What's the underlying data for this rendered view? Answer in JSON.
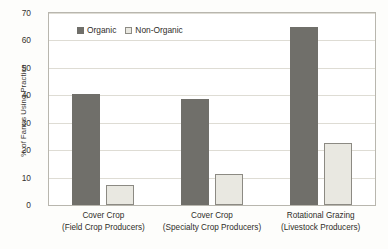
{
  "chart_data": {
    "type": "bar",
    "title": "",
    "xlabel": "",
    "ylabel": "% of Farms Using Practice",
    "ylim": [
      0,
      70
    ],
    "yticks": [
      0,
      10,
      20,
      30,
      40,
      50,
      60,
      70
    ],
    "ytick_labels": [
      "0",
      "10",
      "20",
      "30",
      "40",
      "50",
      "60",
      "70"
    ],
    "grid": true,
    "legend_position": "top-left",
    "categories": [
      "Cover Crop (Field Crop Producers)",
      "Cover Crop (Specialty Crop Producers)",
      "Rotational Grazing (Livestock Producers)"
    ],
    "category_lines": [
      {
        "line1": "Cover Crop",
        "line2": "(Field Crop Producers)"
      },
      {
        "line1": "Cover Crop",
        "line2": "(Specialty Crop Producers)"
      },
      {
        "line1": "Rotational Grazing",
        "line2": "(Livestock Producers)"
      }
    ],
    "series": [
      {
        "name": "Organic",
        "color": "#706f6a",
        "values": [
          40.3,
          38.6,
          65.0
        ]
      },
      {
        "name": "Non-Organic",
        "color": "#e9e8e1",
        "values": [
          7.4,
          11.4,
          22.6
        ]
      }
    ]
  },
  "legend": {
    "entries": [
      {
        "label": "Organic"
      },
      {
        "label": "Non-Organic"
      }
    ]
  },
  "axes": {
    "y_title": "% of Farms Using Practice"
  },
  "colors": {
    "organic": "#706f6a",
    "non_organic": "#e9e8e1",
    "non_organic_border": "#8c8a83",
    "gridline": "#dedcd4",
    "frame": "#b8b6ae",
    "text": "#33312d",
    "plot_background": "#ffffff",
    "page_background": "#fdfdfb"
  }
}
